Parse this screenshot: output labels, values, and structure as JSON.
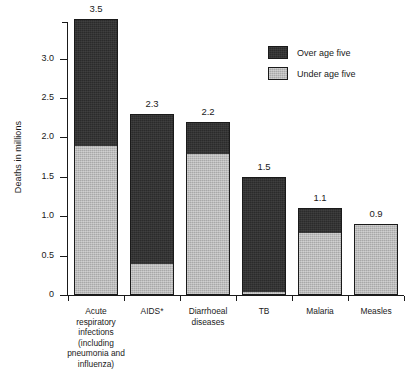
{
  "chart_data": {
    "type": "bar",
    "subtype": "stacked-vertical",
    "title": "",
    "xlabel": "",
    "ylabel": "Deaths in millions",
    "ylim": [
      0,
      3.5
    ],
    "yticks": [
      0,
      0.5,
      1.0,
      1.5,
      2.0,
      2.5,
      3.0
    ],
    "ytick_labels": [
      "0",
      "0.5",
      "1.0",
      "1.5",
      "2.0",
      "2.5",
      "3.0"
    ],
    "grid": false,
    "legend_position": "top-right",
    "categories": [
      "Acute respiratory infections (including pneumonia and influenza)",
      "AIDS*",
      "Diarrhoeal diseases",
      "TB",
      "Malaria",
      "Measles"
    ],
    "category_display": [
      "Acute\nrespiratory\ninfections\n(including\npneumonia and\ninfluenza)",
      "AIDS*",
      "Diarrhoeal\ndiseases",
      "TB",
      "Malaria",
      "Measles"
    ],
    "series": [
      {
        "name": "Under age five",
        "color": "#a8a8a8",
        "values": [
          1.9,
          0.4,
          1.8,
          0.05,
          0.8,
          0.9
        ]
      },
      {
        "name": "Over age five",
        "color": "#2b2b2b",
        "values": [
          1.6,
          1.9,
          0.4,
          1.45,
          0.3,
          0.0
        ]
      }
    ],
    "totals": [
      3.5,
      2.3,
      2.2,
      1.5,
      1.1,
      0.9
    ],
    "total_labels": [
      "3.5",
      "2.3",
      "2.2",
      "1.5",
      "1.1",
      "0.9"
    ]
  },
  "legend": {
    "items": [
      {
        "label": "Over age five",
        "swatch": "over"
      },
      {
        "label": "Under age five",
        "swatch": "under"
      }
    ]
  }
}
